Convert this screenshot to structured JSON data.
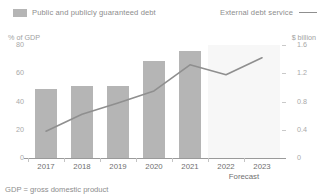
{
  "legend": {
    "series_bar": "Public and publicly guaranteed debt",
    "series_line": "External debt service",
    "bar_swatch_name": "bar-swatch",
    "line_swatch_name": "line-swatch"
  },
  "axes": {
    "y_left_title": "% of GDP",
    "y_right_title": "$ billion",
    "y_left_ticks": [
      "80",
      "60",
      "40",
      "20",
      "0"
    ],
    "y_right_ticks": [
      "1.6",
      "1.2",
      "0.8",
      "0.4",
      "0"
    ],
    "x_labels": [
      "2017",
      "2018",
      "2019",
      "2020",
      "2021",
      "2022",
      "2023"
    ],
    "forecast_label": "Forecast"
  },
  "footnote": "GDP = gross domestic product",
  "colors": {
    "bar": "#b5b5b5",
    "line": "#8f8f8f",
    "forecast_band": "#f7f7f7",
    "axis": "#9a9a9a",
    "text": "#8d8d8d"
  },
  "chart_data": {
    "type": "bar",
    "title": "",
    "subtitle": "",
    "xlabel": "",
    "categories": [
      "2017",
      "2018",
      "2019",
      "2020",
      "2021",
      "2022",
      "2023"
    ],
    "grid": false,
    "legend_position": "top",
    "forecast_years": [
      "2022",
      "2023"
    ],
    "forecast_note": "Forecast",
    "series": [
      {
        "name": "Public and publicly guaranteed debt",
        "type": "bar",
        "axis": "left",
        "unit": "% of GDP",
        "ylabel": "% of GDP",
        "ylim": [
          0,
          80
        ],
        "yticks": [
          0,
          20,
          40,
          60,
          80
        ],
        "values": [
          49,
          51,
          51,
          69,
          76,
          null,
          null
        ]
      },
      {
        "name": "External debt service",
        "type": "line",
        "axis": "right",
        "unit": "$ billion",
        "ylabel": "$ billion",
        "ylim": [
          0,
          1.6
        ],
        "yticks": [
          0,
          0.4,
          0.8,
          1.2,
          1.6
        ],
        "values": [
          0.38,
          0.62,
          0.78,
          0.95,
          1.32,
          1.18,
          1.42
        ]
      }
    ]
  }
}
